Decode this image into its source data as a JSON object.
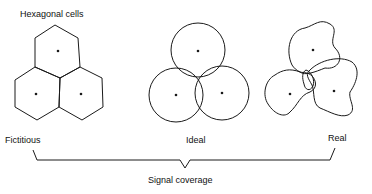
{
  "diagram": {
    "title_hex": "Hexagonal cells",
    "labels": {
      "fictitious": "Fictitious",
      "ideal": "Ideal",
      "real": "Real",
      "coverage": "Signal coverage"
    },
    "panels": [
      {
        "name": "fictitious",
        "shape": "hexagon",
        "cells": 3
      },
      {
        "name": "ideal",
        "shape": "circle",
        "cells": 3
      },
      {
        "name": "real",
        "shape": "irregular",
        "cells": 3
      }
    ],
    "stroke_color": "#1a1a1a"
  }
}
